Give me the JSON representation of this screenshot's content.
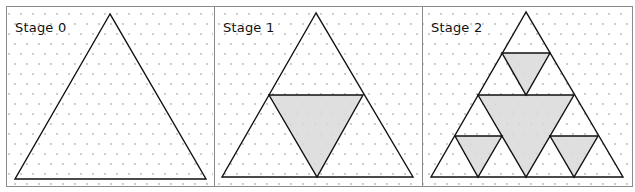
{
  "figure": {
    "colors": {
      "background": "#ffffff",
      "frame": "#8a8a8a",
      "dot": "#b4b4b4",
      "outline": "#111111",
      "shaded": "#d9d9d9"
    },
    "panels": [
      {
        "label": "Stage 0",
        "x": 6,
        "w": 208,
        "outer": [
          [
            110,
            14
          ],
          [
            15,
            179
          ],
          [
            206,
            179
          ]
        ],
        "shaded": []
      },
      {
        "label": "Stage 1",
        "x": 214,
        "w": 208,
        "outer": [
          [
            316,
            13
          ],
          [
            222,
            177
          ],
          [
            413,
            177
          ]
        ],
        "shaded": [
          [
            [
              269,
              95
            ],
            [
              363,
              95
            ],
            [
              317,
              177
            ]
          ]
        ]
      },
      {
        "label": "Stage 2",
        "x": 422,
        "w": 210,
        "outer": [
          [
            526,
            12
          ],
          [
            431,
            177
          ],
          [
            623,
            177
          ]
        ],
        "shaded": [
          [
            [
              478,
              95
            ],
            [
              574,
              95
            ],
            [
              526,
              177
            ]
          ],
          [
            [
              502,
              53
            ],
            [
              550,
              53
            ],
            [
              526,
              95
            ]
          ],
          [
            [
              455,
              136
            ],
            [
              502,
              136
            ],
            [
              478,
              177
            ]
          ],
          [
            [
              550,
              136
            ],
            [
              598,
              136
            ],
            [
              574,
              177
            ]
          ]
        ]
      }
    ]
  }
}
